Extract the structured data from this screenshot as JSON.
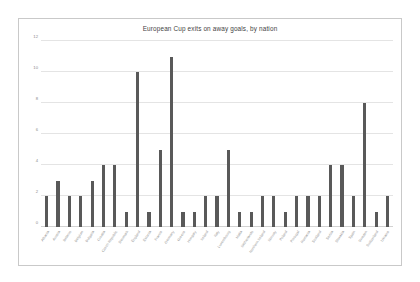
{
  "chart_data": {
    "type": "bar",
    "title": "European Cup exits on away goals, by nation",
    "xlabel": "",
    "ylabel": "",
    "ylim": [
      0,
      12
    ],
    "yticks": [
      0,
      2,
      4,
      6,
      8,
      10,
      12
    ],
    "grid": true,
    "legend": false,
    "bar_color": "#595959",
    "categories": [
      "Albania",
      "Austria",
      "Belarus",
      "Belgium",
      "Bulgaria",
      "Croatia",
      "Czech Republic",
      "Denmark",
      "England",
      "Estonia",
      "France",
      "Germany",
      "Greece",
      "Hungary",
      "Ireland",
      "Italy",
      "Luxembourg",
      "Malta",
      "Netherlands",
      "Northern Ireland",
      "Norway",
      "Poland",
      "Portugal",
      "Romania",
      "Scotland",
      "Serbia",
      "Slovakia",
      "Spain",
      "Sweden",
      "Switzerland",
      "Ukraine"
    ],
    "values": [
      2,
      3,
      2,
      2,
      3,
      4,
      4,
      1,
      10,
      1,
      5,
      11,
      1,
      1,
      2,
      2,
      5,
      1,
      1,
      2,
      2,
      1,
      2,
      2,
      2,
      4,
      4,
      2,
      8,
      1,
      2
    ]
  }
}
